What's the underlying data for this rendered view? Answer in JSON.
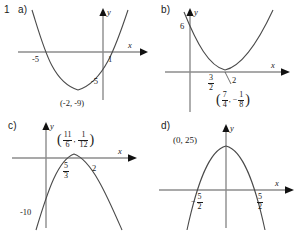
{
  "figure": {
    "question_number": "1",
    "type": "parabola-graph-set",
    "panel_count": 4,
    "axis_color": "#8c8c8c",
    "curve_color": "#4a4a4a",
    "text_color": "#1a1a1a",
    "background": "#ffffff"
  },
  "panels": [
    {
      "id": "a",
      "letter": "a)",
      "axis_x_label": "x",
      "axis_y_label": "y",
      "opens": "up",
      "x_intercepts": [
        "-5",
        "1"
      ],
      "y_intercept": "-5",
      "vertex_label": "(-2, -9)",
      "vertex": {
        "x": "-2",
        "y": "-9"
      }
    },
    {
      "id": "b",
      "letter": "b)",
      "axis_x_label": "x",
      "axis_y_label": "y",
      "opens": "up",
      "y_intercept": "6",
      "x_intercepts": [
        {
          "num": "3",
          "den": "2"
        },
        {
          "whole": "2"
        }
      ],
      "vertex_label_x": {
        "num": "7",
        "den": "4"
      },
      "vertex_label_y": {
        "num": "1",
        "den": "8",
        "negative": true
      }
    },
    {
      "id": "c",
      "letter": "c)",
      "axis_x_label": "x",
      "axis_y_label": "y",
      "opens": "down",
      "y_intercept": "-10",
      "x_intercepts": [
        {
          "num": "5",
          "den": "3"
        },
        {
          "whole": "2"
        }
      ],
      "vertex_label_x": {
        "num": "11",
        "den": "6"
      },
      "vertex_label_y": {
        "num": "1",
        "den": "12"
      }
    },
    {
      "id": "d",
      "letter": "d)",
      "axis_x_label": "x",
      "axis_y_label": "y",
      "opens": "down",
      "vertex_label": "(0, 25)",
      "x_intercepts": [
        {
          "num": "5",
          "den": "2",
          "negative": true
        },
        {
          "num": "5",
          "den": "2"
        }
      ]
    }
  ]
}
